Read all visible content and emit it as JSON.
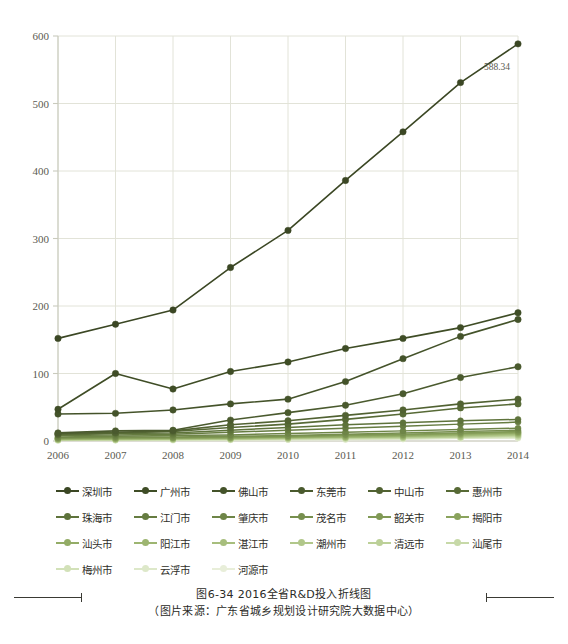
{
  "caption": {
    "line1": "图6-34   2016全省R&D投入折线图",
    "line2": "（图片来源：广东省城乡规划设计研究院大数据中心）"
  },
  "annotation": {
    "top_value_label": "588.34"
  },
  "chart_data": {
    "type": "line",
    "title": "图6-34   2016全省R&D投入折线图",
    "xlabel": "",
    "ylabel": "",
    "x": [
      "2006",
      "2007",
      "2008",
      "2009",
      "2010",
      "2011",
      "2012",
      "2013",
      "2014"
    ],
    "categories": [
      "2006",
      "2007",
      "2008",
      "2009",
      "2010",
      "2011",
      "2012",
      "2013",
      "2014"
    ],
    "ylim": [
      0,
      600
    ],
    "yticks": [
      0,
      100,
      200,
      300,
      400,
      500,
      600
    ],
    "ytick_labels": [
      "0",
      "100",
      "200",
      "300",
      "400",
      "500",
      "600"
    ],
    "grid": true,
    "legend_position": "bottom",
    "data_labels": [
      {
        "series": "深圳市",
        "x": "2014",
        "value": 588.34,
        "text": "588.34"
      }
    ],
    "series": [
      {
        "name": "深圳市",
        "color": "#3b4724",
        "values": [
          152,
          173,
          194,
          257,
          312,
          386,
          458,
          531,
          588.34
        ]
      },
      {
        "name": "广州市",
        "color": "#3f4d26",
        "values": [
          47,
          100,
          77,
          103,
          117,
          137,
          152,
          168,
          190
        ]
      },
      {
        "name": "佛山市",
        "color": "#44532a",
        "values": [
          40,
          41,
          46,
          55,
          62,
          88,
          122,
          155,
          180
        ]
      },
      {
        "name": "东莞市",
        "color": "#4a5a2e",
        "values": [
          12,
          15,
          16,
          31,
          42,
          53,
          70,
          94,
          110
        ]
      },
      {
        "name": "中山市",
        "color": "#516232",
        "values": [
          11,
          13,
          15,
          24,
          30,
          38,
          46,
          55,
          62
        ]
      },
      {
        "name": "惠州市",
        "color": "#576a36",
        "values": [
          10,
          12,
          14,
          20,
          25,
          32,
          40,
          49,
          55
        ]
      },
      {
        "name": "珠海市",
        "color": "#5e733b",
        "values": [
          9,
          11,
          12,
          16,
          20,
          24,
          27,
          30,
          32
        ]
      },
      {
        "name": "江门市",
        "color": "#667c41",
        "values": [
          8,
          9,
          10,
          13,
          16,
          19,
          22,
          25,
          28
        ]
      },
      {
        "name": "肇庆市",
        "color": "#6e8547",
        "values": [
          6,
          7,
          8,
          9,
          11,
          13,
          15,
          17,
          19
        ]
      },
      {
        "name": "茂名市",
        "color": "#778f4e",
        "values": [
          5,
          6,
          6,
          7,
          8,
          10,
          12,
          14,
          16
        ]
      },
      {
        "name": "韶关市",
        "color": "#809955",
        "values": [
          4,
          5,
          5,
          6,
          7,
          9,
          10,
          12,
          14
        ]
      },
      {
        "name": "揭阳市",
        "color": "#8aa35d",
        "values": [
          4,
          4,
          5,
          5,
          6,
          8,
          9,
          11,
          13
        ]
      },
      {
        "name": "汕头市",
        "color": "#93ac66",
        "values": [
          3,
          4,
          4,
          5,
          6,
          7,
          8,
          10,
          12
        ]
      },
      {
        "name": "阳江市",
        "color": "#9db571",
        "values": [
          3,
          3,
          4,
          4,
          5,
          6,
          7,
          9,
          11
        ]
      },
      {
        "name": "湛江市",
        "color": "#a7be7d",
        "values": [
          3,
          3,
          3,
          4,
          5,
          6,
          7,
          8,
          10
        ]
      },
      {
        "name": "潮州市",
        "color": "#b1c78a",
        "values": [
          2,
          3,
          3,
          3,
          4,
          5,
          6,
          7,
          9
        ]
      },
      {
        "name": "清远市",
        "color": "#bcd098",
        "values": [
          2,
          2,
          3,
          3,
          4,
          5,
          5,
          6,
          8
        ]
      },
      {
        "name": "汕尾市",
        "color": "#c7d9a8",
        "values": [
          2,
          2,
          2,
          3,
          3,
          4,
          5,
          6,
          7
        ]
      },
      {
        "name": "梅州市",
        "color": "#d2e1b8",
        "values": [
          1,
          2,
          2,
          2,
          3,
          3,
          4,
          5,
          6
        ]
      },
      {
        "name": "云浮市",
        "color": "#dde8c9",
        "values": [
          1,
          1,
          2,
          2,
          2,
          3,
          3,
          4,
          5
        ]
      },
      {
        "name": "河源市",
        "color": "#e8eed9",
        "values": [
          1,
          1,
          1,
          2,
          2,
          2,
          3,
          4,
          4
        ]
      }
    ]
  },
  "legend": {
    "rows": [
      [
        {
          "label": "深圳市",
          "color": "#3b4724"
        },
        {
          "label": "广州市",
          "color": "#3f4d26"
        },
        {
          "label": "佛山市",
          "color": "#44532a"
        },
        {
          "label": "东莞市",
          "color": "#4a5a2e"
        },
        {
          "label": "中山市",
          "color": "#516232"
        },
        {
          "label": "惠州市",
          "color": "#576a36"
        }
      ],
      [
        {
          "label": "珠海市",
          "color": "#5e733b"
        },
        {
          "label": "江门市",
          "color": "#667c41"
        },
        {
          "label": "肇庆市",
          "color": "#6e8547"
        },
        {
          "label": "茂名市",
          "color": "#778f4e"
        },
        {
          "label": "韶关市",
          "color": "#809955"
        },
        {
          "label": "揭阳市",
          "color": "#8aa35d"
        }
      ],
      [
        {
          "label": "汕头市",
          "color": "#93ac66"
        },
        {
          "label": "阳江市",
          "color": "#9db571"
        },
        {
          "label": "湛江市",
          "color": "#a7be7d"
        },
        {
          "label": "潮州市",
          "color": "#b1c78a"
        },
        {
          "label": "清远市",
          "color": "#bcd098"
        },
        {
          "label": "汕尾市",
          "color": "#c7d9a8"
        }
      ],
      [
        {
          "label": "梅州市",
          "color": "#d2e1b8"
        },
        {
          "label": "云浮市",
          "color": "#dde8c9"
        },
        {
          "label": "河源市",
          "color": "#e8eed9"
        }
      ]
    ]
  },
  "colors": {
    "grid": "#e2e3d8",
    "axis": "#c9cabd",
    "text": "#5b5b52",
    "darkest_series": "#3b4724",
    "lightest_series": "#e8eed9"
  }
}
